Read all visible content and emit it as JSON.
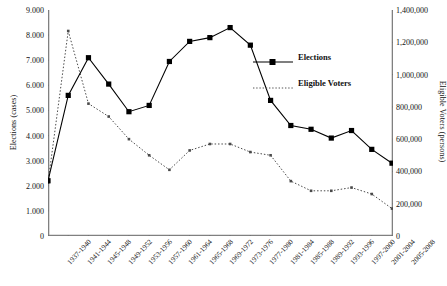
{
  "chart_data": {
    "type": "line",
    "title": "",
    "xlabel": "",
    "categories": [
      "1937-1940",
      "1941-1944",
      "1945-1948",
      "1949-1952",
      "1953-1956",
      "1957-1960",
      "1961-1964",
      "1965-1968",
      "1969-1972",
      "1973-1976",
      "1977-1980",
      "1981-1984",
      "1985-1988",
      "1989-1992",
      "1993-1996",
      "1997-2000",
      "2001-2004",
      "2005-2008"
    ],
    "series": [
      {
        "name": "Elections",
        "axis": "left",
        "ylabel": "Elections (cases)",
        "ylim": [
          0,
          9000
        ],
        "ytick_step": 1000,
        "yticks": [
          "0",
          "1.000",
          "2.000",
          "3.000",
          "4.000",
          "5.000",
          "6.000",
          "7.000",
          "8.000",
          "9.000"
        ],
        "style": "solid-line-square-markers",
        "values": [
          2200,
          5600,
          7100,
          6050,
          4950,
          5200,
          6950,
          7750,
          7900,
          8300,
          7600,
          5400,
          4400,
          4250,
          3900,
          4200,
          3450,
          2900
        ]
      },
      {
        "name": "Eligible Voters",
        "axis": "right",
        "ylabel": "Eligible Voters (persons)",
        "ylim": [
          0,
          1400000
        ],
        "ytick_step": 200000,
        "yticks": [
          "0",
          "200,000",
          "400,000",
          "600,000",
          "800,000",
          "1,000,000",
          "1,200,000",
          "1,400,000"
        ],
        "style": "dotted-line",
        "values": [
          330000,
          1270000,
          820000,
          740000,
          600000,
          500000,
          410000,
          530000,
          570000,
          570000,
          520000,
          500000,
          340000,
          280000,
          280000,
          300000,
          260000,
          170000
        ]
      }
    ],
    "grid": false,
    "legend_position": "inside-right",
    "colors": {
      "elections": "#000000",
      "eligible_voters": "#555555",
      "axis": "#666666"
    }
  }
}
